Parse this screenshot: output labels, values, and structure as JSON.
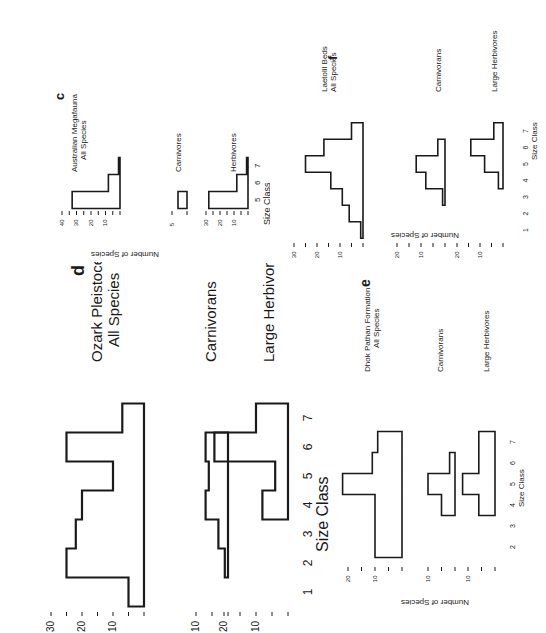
{
  "chart_data": [
    {
      "panel": "c",
      "type": "bar",
      "title": "Australian Megafauna",
      "xlabel": "Size Class",
      "ylabel": "Number of Species",
      "x_ticks": [
        "5",
        "6",
        "7"
      ],
      "subplots": [
        {
          "name": "All Species",
          "categories": [
            5,
            6,
            7
          ],
          "values": [
            33,
            8,
            1
          ],
          "y_ticks": [
            10,
            20,
            30,
            40
          ],
          "ylim": [
            0,
            40
          ]
        },
        {
          "name": "Carnivores",
          "categories": [
            5
          ],
          "values": [
            3
          ],
          "y_ticks": [
            5
          ],
          "ylim": [
            0,
            5
          ]
        },
        {
          "name": "Herbivores",
          "categories": [
            5,
            6,
            7
          ],
          "values": [
            28,
            8,
            1
          ],
          "y_ticks": [
            10,
            20,
            30
          ],
          "ylim": [
            0,
            30
          ]
        }
      ]
    },
    {
      "panel": "d",
      "type": "bar",
      "title": "Ozark Pleistocene",
      "xlabel": "Size Class",
      "ylabel": "Number of Species",
      "x_ticks": [
        "1",
        "2",
        "3",
        "4",
        "5",
        "6",
        "7"
      ],
      "subplots": [
        {
          "name": "All Species",
          "categories": [
            1,
            2,
            3,
            4,
            5,
            6,
            7
          ],
          "values": [
            5,
            25,
            22,
            20,
            10,
            25,
            7
          ],
          "y_ticks": [
            10,
            20,
            30
          ],
          "ylim": [
            0,
            30
          ]
        },
        {
          "name": "Carnivorans",
          "categories": [
            2,
            3,
            4,
            5,
            6
          ],
          "values": [
            1,
            3,
            7,
            6,
            7
          ],
          "y_ticks": [
            10
          ],
          "ylim": [
            0,
            10
          ]
        },
        {
          "name": "Large Herbivores",
          "categories": [
            4,
            5,
            6,
            7
          ],
          "values": [
            8,
            4,
            23,
            10
          ],
          "y_ticks": [
            10,
            20
          ],
          "ylim": [
            0,
            20
          ]
        }
      ]
    },
    {
      "panel": "e",
      "type": "bar",
      "title": "Dhok Pathan Formation",
      "xlabel": "Size Class",
      "ylabel": "Number of Species",
      "x_ticks": [
        "2",
        "3",
        "4",
        "5",
        "6",
        "7"
      ],
      "subplots": [
        {
          "name": "All Species",
          "categories": [
            2,
            3,
            4,
            5,
            6,
            7
          ],
          "values": [
            10,
            10,
            10,
            22,
            11,
            9
          ],
          "y_ticks": [
            10,
            20
          ],
          "ylim": [
            0,
            20
          ]
        },
        {
          "name": "Carnivorans",
          "categories": [
            4,
            5,
            6
          ],
          "values": [
            5,
            10,
            2
          ],
          "y_ticks": [
            10
          ],
          "ylim": [
            0,
            10
          ]
        },
        {
          "name": "Large Herbivores",
          "categories": [
            4,
            5,
            6,
            7
          ],
          "values": [
            6,
            12,
            6,
            6
          ],
          "y_ticks": [
            10
          ],
          "ylim": [
            0,
            10
          ]
        }
      ]
    },
    {
      "panel": "f",
      "type": "bar",
      "title": "Laetolil Beds",
      "xlabel": "Size Class",
      "ylabel": "Number of Species",
      "x_ticks": [
        "1",
        "2",
        "3",
        "4",
        "5",
        "6",
        "7"
      ],
      "subplots": [
        {
          "name": "All Species",
          "categories": [
            1,
            2,
            3,
            4,
            5,
            6,
            7
          ],
          "values": [
            1,
            6,
            9,
            14,
            25,
            17,
            5
          ],
          "y_ticks": [
            10,
            20,
            30
          ],
          "ylim": [
            0,
            30
          ]
        },
        {
          "name": "Carnivorans",
          "categories": [
            3,
            4,
            5,
            6
          ],
          "values": [
            1,
            8,
            12,
            3
          ],
          "y_ticks": [
            10,
            20
          ],
          "ylim": [
            0,
            20
          ]
        },
        {
          "name": "Large Herbivores",
          "categories": [
            4,
            5,
            6,
            7
          ],
          "values": [
            2,
            8,
            14,
            4
          ],
          "y_ticks": [
            10,
            20
          ],
          "ylim": [
            0,
            20
          ]
        }
      ]
    }
  ],
  "labels": {
    "c": {
      "letter": "c",
      "title_line1": "Australian Megafauna",
      "title_line2": "All Species",
      "carn": "Carnivores",
      "herb": "Herbivores",
      "xlabel": "Size Class",
      "ylabel": "Number of Species"
    },
    "d": {
      "letter": "d",
      "title_line1": "Ozark Pleistocene",
      "title_line2": "All Species",
      "carn": "Carnivorans",
      "herb": "Large Herbivores",
      "xlabel": "Size Class"
    },
    "e": {
      "letter": "e",
      "title_line1": "Dhok Pathan Formation",
      "title_line2": "All Species",
      "carn": "Carnivorans",
      "herb": "Large Herbivores",
      "xlabel": "Size Class",
      "ylabel": "Number of Species"
    },
    "f": {
      "letter": "f",
      "title_line1": "Laetolil Beds",
      "title_line2": "All Species",
      "carn": "Carnivorans",
      "herb": "Large Herbivores",
      "xlabel": "Size Class",
      "ylabel": "Number of Species"
    }
  }
}
